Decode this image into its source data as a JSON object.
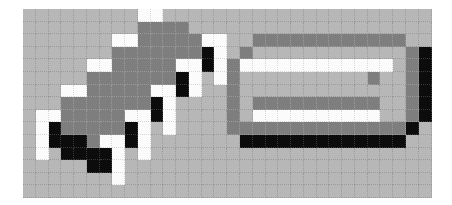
{
  "board": {
    "cols": 32,
    "rows": 15,
    "colors": {
      "bg": "#b7b7b7",
      "dark": "#7e7e7e",
      "white": "#fbfbfb",
      "black": "#0c0c0c"
    },
    "legend": {
      ".": "bg",
      "d": "dark",
      "w": "white",
      "b": "black"
    },
    "grid": [
      ".........ww.....................",
      ".........dddd...................",
      ".......wwdddddww..dddddddddddd..",
      ".......dddddddbw.d............db",
      ".....wwdddddwwbwdwwwwwwwwwwww.db",
      ".....dddddddbw.wd..........d..db",
      "...wwdddddwwbw..d.............db",
      "...dddddddbw....d.dddddddddd..db",
      ".wwdddddwwbw....d.wwwwwwwwww..db",
      ".wbdddddbw.w....ddddddddddddddb.",
      ".wbbbdwwbw.......bbbbbbbbbbbbb..",
      ".w.bbbbw.w......................",
      ".....bbw........................",
      ".......w........................",
      "................................"
    ]
  },
  "shapes": [
    {
      "name": "diagonal-ramp",
      "description": "diagonal staircase body"
    },
    {
      "name": "rounded-frame",
      "description": "rectangular frame with inner bars"
    }
  ]
}
